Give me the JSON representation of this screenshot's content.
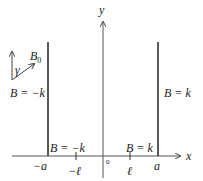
{
  "diagram": {
    "axes": {
      "x_label": "x",
      "y_label": "y",
      "origin_label": "0"
    },
    "ticks": {
      "neg_a": "−a",
      "neg_l": "−ℓ",
      "l": "ℓ",
      "a": "a"
    },
    "regions": {
      "left_wall": "B = −k",
      "right_wall": "B = k",
      "left_bottom": "B = −k",
      "right_bottom": "B = k"
    },
    "inset": {
      "field_label": "B",
      "field_sub": "0",
      "angle_label": "γ"
    },
    "colors": {
      "line": "#222222",
      "axis": "#555555"
    }
  }
}
